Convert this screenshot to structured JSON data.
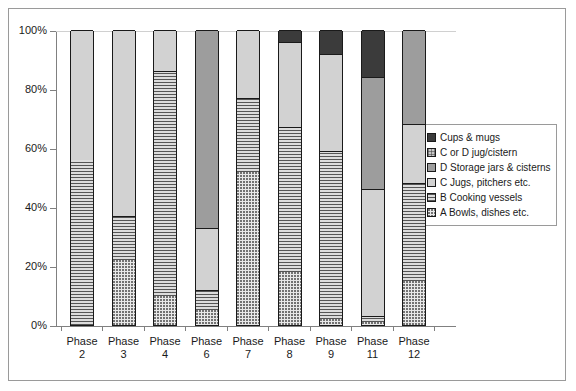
{
  "chart_data": {
    "type": "bar",
    "subtype": "stacked-100-percent",
    "title": "",
    "xlabel": "",
    "ylabel": "",
    "ylim": [
      0,
      100
    ],
    "ytick_labels": [
      "0%",
      "20%",
      "40%",
      "60%",
      "80%",
      "100%"
    ],
    "ytick_values": [
      0,
      20,
      40,
      60,
      80,
      100
    ],
    "grid": false,
    "legend_position": "right",
    "categories": [
      "Phase 2",
      "Phase 3",
      "Phase 4",
      "Phase 6",
      "Phase 7",
      "Phase 8",
      "Phase 9",
      "Phase 11",
      "Phase 12"
    ],
    "category_lines": [
      [
        "Phase",
        "2"
      ],
      [
        "Phase",
        "3"
      ],
      [
        "Phase",
        "4"
      ],
      [
        "Phase",
        "6"
      ],
      [
        "Phase",
        "7"
      ],
      [
        "Phase",
        "8"
      ],
      [
        "Phase",
        "9"
      ],
      [
        "Phase",
        "11"
      ],
      [
        "Phase",
        "12"
      ]
    ],
    "series": [
      {
        "name": "A  Bowls, dishes etc.",
        "key": "a",
        "values": [
          0,
          22,
          10,
          5,
          52,
          18,
          2,
          1,
          15
        ]
      },
      {
        "name": "B  Cooking vessels",
        "key": "b",
        "values": [
          56,
          15,
          76,
          7,
          25,
          49,
          57,
          2,
          33
        ]
      },
      {
        "name": "C  Jugs, pitchers etc.",
        "key": "c",
        "values": [
          44,
          63,
          14,
          21,
          23,
          29,
          33,
          43,
          20
        ]
      },
      {
        "name": "D  Storage jars & cisterns",
        "key": "d",
        "values": [
          0,
          0,
          0,
          67,
          0,
          0,
          0,
          38,
          32
        ]
      },
      {
        "name": "C or D jug/cistern",
        "key": "cd",
        "values": [
          0,
          0,
          0,
          0,
          0,
          0,
          0,
          0,
          0
        ]
      },
      {
        "name": "Cups & mugs",
        "key": "cups",
        "values": [
          0,
          0,
          0,
          0,
          0,
          4,
          8,
          16,
          0
        ]
      }
    ]
  },
  "legend": {
    "items": [
      {
        "label": "Cups & mugs",
        "swatch": "cups"
      },
      {
        "label": "C or D jug/cistern",
        "swatch": "cd"
      },
      {
        "label": "D  Storage jars & cisterns",
        "swatch": "d"
      },
      {
        "label": "C  Jugs, pitchers etc.",
        "swatch": "c"
      },
      {
        "label": "B  Cooking vessels",
        "swatch": "b"
      },
      {
        "label": "A  Bowls, dishes etc.",
        "swatch": "a"
      }
    ]
  },
  "colors": {
    "cups": "#3b3b3b",
    "cd": "#c8c8c8",
    "d": "#9d9d9d",
    "c": "#d2d2d2",
    "b": "#c4c4c4",
    "a": "#e8e8e8",
    "axis": "#808080",
    "outline": "#1a1a1a"
  }
}
